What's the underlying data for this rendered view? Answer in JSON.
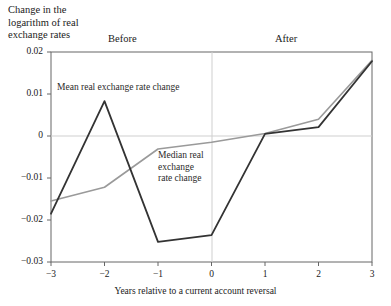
{
  "figure": {
    "title": "Change in the\nlogarithm of real\nexchange rates",
    "period_before": "Before",
    "period_after": "After",
    "xlabel": "Years relative to a current account reversal",
    "annotation_mean": "Mean real exchange rate change",
    "annotation_median": "Median real\nexchange\nrate change"
  },
  "colors": {
    "mean_line": "#333333",
    "median_line": "#9a9a9a",
    "axis": "#555555",
    "gridline": "#cccccc",
    "text": "#1a1a1a",
    "background": "#ffffff"
  },
  "chart_data": {
    "type": "line",
    "title": "Change in the logarithm of real exchange rates",
    "xlabel": "Years relative to a current account reversal",
    "ylabel": "Change in the logarithm of real exchange rates",
    "x": [
      -3,
      -2,
      -1,
      0,
      1,
      2,
      3
    ],
    "xticklabels": [
      "−3",
      "−2",
      "−1",
      "0",
      "1",
      "2",
      "3"
    ],
    "yticks": [
      0.02,
      0.01,
      0,
      -0.01,
      -0.02,
      -0.03
    ],
    "yticklabels": [
      "0.02",
      "0.01",
      "0",
      "−0.01",
      "−0.02",
      "−0.03"
    ],
    "xlim": [
      -3,
      3
    ],
    "ylim": [
      -0.03,
      0.02
    ],
    "grid": "zero-horizontal-and-vertical-at-x0",
    "legend": "inline-annotations",
    "series": [
      {
        "name": "Mean real exchange rate change",
        "color": "#333333",
        "values": [
          -0.0185,
          0.0083,
          -0.0252,
          -0.0236,
          0.0005,
          0.0021,
          0.0178
        ]
      },
      {
        "name": "Median real exchange rate change",
        "color": "#9a9a9a",
        "values": [
          -0.0155,
          -0.0122,
          -0.0031,
          -0.0015,
          0.0006,
          0.004,
          0.018
        ]
      }
    ],
    "annotations": [
      {
        "text": "Before",
        "x": -1.6,
        "note": "period label above plot"
      },
      {
        "text": "After",
        "x": 1.5,
        "note": "period label above plot"
      }
    ]
  },
  "ticks": {
    "y": [
      "0.02",
      "0.01",
      "0",
      "−0.01",
      "−0.02",
      "−0.03"
    ],
    "x": [
      "−3",
      "−2",
      "−1",
      "0",
      "1",
      "2",
      "3"
    ]
  }
}
